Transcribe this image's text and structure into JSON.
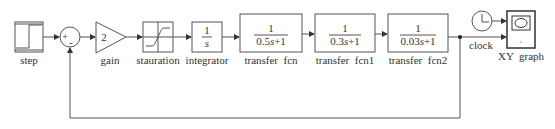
{
  "diagram": {
    "type": "simulink-block-diagram",
    "blocks": [
      {
        "id": "step",
        "label": "step",
        "kind": "step-source"
      },
      {
        "id": "sum",
        "label": "",
        "kind": "sum",
        "signs": {
          "plus": "+",
          "minus": "-"
        }
      },
      {
        "id": "gain",
        "label": "gain",
        "kind": "gain",
        "value": "2"
      },
      {
        "id": "saturation",
        "label": "stauration",
        "kind": "saturation"
      },
      {
        "id": "integrator",
        "label": "integrator",
        "kind": "integrator",
        "num": "1",
        "den": "s"
      },
      {
        "id": "tf0",
        "label": "transfer  fcn",
        "kind": "transfer-function",
        "num": "1",
        "den_coef": "0.5",
        "den_var": "s",
        "den_tail": "+1"
      },
      {
        "id": "tf1",
        "label": "transfer  fcn1",
        "kind": "transfer-function",
        "num": "1",
        "den_coef": "0.3",
        "den_var": "s",
        "den_tail": "+1"
      },
      {
        "id": "tf2",
        "label": "transfer  fcn2",
        "kind": "transfer-function",
        "num": "1",
        "den_coef": "0.03",
        "den_var": "s",
        "den_tail": "+1"
      },
      {
        "id": "clock",
        "label": "clock",
        "kind": "clock"
      },
      {
        "id": "xy",
        "label": "XY  graph",
        "kind": "xy-graph"
      }
    ],
    "connections": [
      [
        "step",
        "sum.+"
      ],
      [
        "sum",
        "gain"
      ],
      [
        "gain",
        "saturation"
      ],
      [
        "saturation",
        "integrator"
      ],
      [
        "integrator",
        "tf0"
      ],
      [
        "tf0",
        "tf1"
      ],
      [
        "tf1",
        "tf2"
      ],
      [
        "tf2",
        "xy.in2"
      ],
      [
        "clock",
        "xy.in1"
      ],
      [
        "tf2",
        "sum.-"
      ]
    ],
    "colors": {
      "line": "#555555",
      "text": "#333333",
      "background": "#ffffff"
    }
  }
}
